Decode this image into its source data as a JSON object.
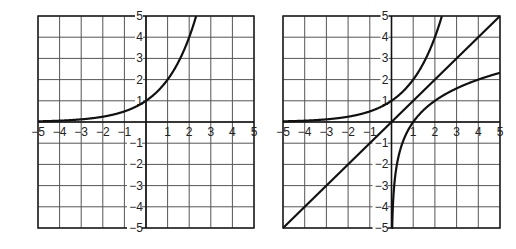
{
  "chart_data": [
    {
      "type": "line",
      "title": "",
      "xlabel": "",
      "ylabel": "",
      "xlim": [
        -5,
        5
      ],
      "ylim": [
        -5,
        5
      ],
      "grid": true,
      "x_ticks": [
        "−5",
        "−4",
        "−3",
        "−2",
        "−1",
        "1",
        "2",
        "3",
        "4",
        "5"
      ],
      "y_ticks": [
        "5",
        "4",
        "3",
        "2",
        "1",
        "−1",
        "−2",
        "−3",
        "−4",
        "−5"
      ],
      "series": [
        {
          "name": "y = 2^x",
          "x": [
            -5,
            -4,
            -3,
            -2,
            -1,
            0,
            1,
            2,
            2.32
          ],
          "values": [
            0.03,
            0.06,
            0.13,
            0.25,
            0.5,
            1,
            2,
            4,
            5
          ]
        }
      ],
      "frame": {
        "left": 38,
        "top": 16,
        "right": 254,
        "bottom": 228
      }
    },
    {
      "type": "line",
      "title": "",
      "xlabel": "",
      "ylabel": "",
      "xlim": [
        -5,
        5
      ],
      "ylim": [
        -5,
        5
      ],
      "grid": true,
      "x_ticks": [
        "−5",
        "−4",
        "−3",
        "−2",
        "−1",
        "1",
        "2",
        "3",
        "4",
        "5"
      ],
      "y_ticks": [
        "5",
        "4",
        "3",
        "2",
        "1",
        "−1",
        "−2",
        "−3",
        "−4",
        "−5"
      ],
      "series": [
        {
          "name": "y = 2^x",
          "x": [
            -5,
            -4,
            -3,
            -2,
            -1,
            0,
            1,
            2,
            2.32
          ],
          "values": [
            0.03,
            0.06,
            0.13,
            0.25,
            0.5,
            1,
            2,
            4,
            5
          ]
        },
        {
          "name": "y = x",
          "x": [
            -5,
            5
          ],
          "values": [
            -5,
            5
          ]
        },
        {
          "name": "y = log2(x)",
          "x": [
            0.03,
            0.0625,
            0.125,
            0.25,
            0.5,
            1,
            2,
            3,
            4,
            5
          ],
          "values": [
            -5,
            -4,
            -3,
            -2,
            -1,
            0,
            1,
            1.58,
            2,
            2.32
          ]
        }
      ],
      "frame": {
        "left": 283,
        "top": 16,
        "right": 500,
        "bottom": 228
      }
    }
  ]
}
